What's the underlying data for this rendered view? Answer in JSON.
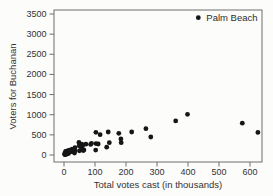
{
  "style": {
    "dot_color": "#161616",
    "frame_color": "#6e6e6e",
    "tick_color": "#6e6e6e",
    "text_color": "#333333",
    "background": "#fcfcfb"
  },
  "chart_data": {
    "type": "scatter",
    "title": "",
    "xlabel": "Total votes cast (in thousands)",
    "ylabel": "Voters for Buchanan",
    "xlim": [
      0,
      600
    ],
    "ylim": [
      0,
      3500
    ],
    "x_ticks": [
      0,
      100,
      200,
      300,
      400,
      500,
      600
    ],
    "y_ticks": [
      0,
      500,
      1000,
      1500,
      2000,
      2500,
      3000,
      3500
    ],
    "grid": false,
    "legend": "none",
    "annotation": {
      "label": "Palm Beach",
      "x": 433.2,
      "y": 3407
    },
    "points": [
      [
        85.7,
        263
      ],
      [
        8.2,
        73
      ],
      [
        58.8,
        248
      ],
      [
        8.7,
        65
      ],
      [
        218.4,
        570
      ],
      [
        575.1,
        789
      ],
      [
        5.2,
        90
      ],
      [
        35.4,
        182
      ],
      [
        57.2,
        270
      ],
      [
        57.4,
        186
      ],
      [
        102.2,
        122
      ],
      [
        18.5,
        89
      ],
      [
        625.4,
        561
      ],
      [
        8.8,
        36
      ],
      [
        4.7,
        29
      ],
      [
        264.3,
        652
      ],
      [
        116.6,
        504
      ],
      [
        27.1,
        83
      ],
      [
        4.6,
        33
      ],
      [
        14.7,
        39
      ],
      [
        5.4,
        29
      ],
      [
        3.4,
        9
      ],
      [
        6.1,
        71
      ],
      [
        4.3,
        24
      ],
      [
        6.7,
        30
      ],
      [
        9.9,
        22
      ],
      [
        60.6,
        242
      ],
      [
        35.1,
        99
      ],
      [
        360.3,
        847
      ],
      [
        7.4,
        76
      ],
      [
        49.6,
        105
      ],
      [
        18.1,
        102
      ],
      [
        5.6,
        29
      ],
      [
        2.4,
        10
      ],
      [
        88.6,
        289
      ],
      [
        184.4,
        305
      ],
      [
        103.1,
        282
      ],
      [
        12.7,
        67
      ],
      [
        2.4,
        39
      ],
      [
        7.0,
        29
      ],
      [
        110.2,
        272
      ],
      [
        102.9,
        563
      ],
      [
        62.0,
        108
      ],
      [
        33.9,
        47
      ],
      [
        23.8,
        90
      ],
      [
        70.7,
        267
      ],
      [
        12.1,
        43
      ],
      [
        280.1,
        446
      ],
      [
        55.7,
        145
      ],
      [
        433.2,
        3407
      ],
      [
        142.7,
        570
      ],
      [
        398.5,
        1010
      ],
      [
        176.8,
        538
      ],
      [
        26.2,
        147
      ],
      [
        49.0,
        229
      ],
      [
        64.3,
        124
      ],
      [
        48.0,
        311
      ],
      [
        146.0,
        305
      ],
      [
        137.6,
        194
      ],
      [
        22.3,
        114
      ],
      [
        12.5,
        108
      ],
      [
        6.8,
        27
      ],
      [
        3.8,
        26
      ],
      [
        183.7,
        396
      ],
      [
        8.6,
        46
      ],
      [
        18.3,
        120
      ],
      [
        8.0,
        88
      ]
    ]
  }
}
